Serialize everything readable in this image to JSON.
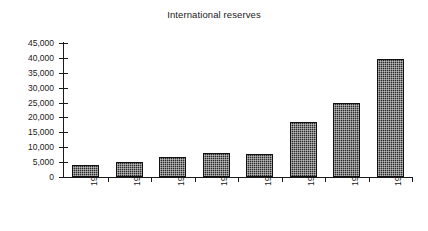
{
  "chart_data": {
    "type": "bar",
    "title": "International reserves",
    "subtitle": "",
    "xlabel": "",
    "ylabel": "",
    "categories": [
      "1987",
      "1988",
      "1989",
      "1990",
      "1991",
      "1992",
      "1993",
      "1994*"
    ],
    "values": [
      4000,
      5000,
      6800,
      8000,
      7700,
      18500,
      25000,
      39500
    ],
    "ylim": [
      0,
      45000
    ],
    "ytick_values": [
      0,
      5000,
      10000,
      15000,
      20000,
      25000,
      30000,
      35000,
      40000,
      45000
    ],
    "ytick_labels": [
      "0",
      "5,000",
      "10,000",
      "15,000",
      "20,000",
      "25,000",
      "30,000",
      "35,000",
      "40,000",
      "45,000"
    ],
    "grid": false,
    "legend": null,
    "legend_position": "none",
    "series": [
      {
        "name": "International reserves",
        "values": [
          4000,
          5000,
          6800,
          8000,
          7700,
          18500,
          25000,
          39500
        ]
      }
    ],
    "annotations": [
      "* denotes provisional / partial-year figure for 1994"
    ],
    "bar_color": "#2b2b2b",
    "bar_fill_pattern": "crosshatch",
    "axis_color": "#1a1a1a",
    "background_color": "#ffffff"
  }
}
